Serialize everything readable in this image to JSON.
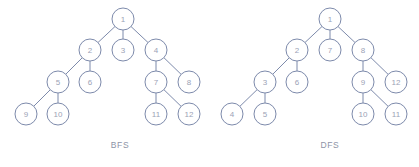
{
  "figure": {
    "background_color": "#ffffff",
    "stroke_color": "#7d8aab",
    "node_text_color": "#9ba2b6",
    "caption_color": "#8d93a6",
    "node_radius": 11,
    "width": 419,
    "height": 167
  },
  "diagrams": [
    {
      "id": "bfs",
      "caption": "BFS",
      "caption_x": 120,
      "caption_y": 145,
      "nodes": [
        {
          "label": "1",
          "x": 123,
          "y": 19
        },
        {
          "label": "2",
          "x": 90,
          "y": 50
        },
        {
          "label": "3",
          "x": 123,
          "y": 50
        },
        {
          "label": "4",
          "x": 156,
          "y": 50
        },
        {
          "label": "5",
          "x": 58,
          "y": 82
        },
        {
          "label": "6",
          "x": 90,
          "y": 82
        },
        {
          "label": "7",
          "x": 156,
          "y": 82
        },
        {
          "label": "8",
          "x": 189,
          "y": 82
        },
        {
          "label": "9",
          "x": 26,
          "y": 114
        },
        {
          "label": "10",
          "x": 58,
          "y": 114
        },
        {
          "label": "11",
          "x": 156,
          "y": 114
        },
        {
          "label": "12",
          "x": 189,
          "y": 114
        }
      ],
      "edges": [
        {
          "from": "1",
          "to": "2"
        },
        {
          "from": "1",
          "to": "3"
        },
        {
          "from": "1",
          "to": "4"
        },
        {
          "from": "2",
          "to": "5"
        },
        {
          "from": "2",
          "to": "6"
        },
        {
          "from": "4",
          "to": "7"
        },
        {
          "from": "4",
          "to": "8"
        },
        {
          "from": "5",
          "to": "9"
        },
        {
          "from": "5",
          "to": "10"
        },
        {
          "from": "7",
          "to": "11"
        },
        {
          "from": "7",
          "to": "12"
        }
      ]
    },
    {
      "id": "dfs",
      "caption": "DFS",
      "caption_x": 330,
      "caption_y": 145,
      "nodes": [
        {
          "label": "1",
          "x": 330,
          "y": 19
        },
        {
          "label": "2",
          "x": 297,
          "y": 50
        },
        {
          "label": "7",
          "x": 330,
          "y": 50
        },
        {
          "label": "8",
          "x": 363,
          "y": 50
        },
        {
          "label": "3",
          "x": 265,
          "y": 82
        },
        {
          "label": "6",
          "x": 297,
          "y": 82
        },
        {
          "label": "9",
          "x": 363,
          "y": 82
        },
        {
          "label": "12",
          "x": 396,
          "y": 82
        },
        {
          "label": "4",
          "x": 232,
          "y": 114
        },
        {
          "label": "5",
          "x": 265,
          "y": 114
        },
        {
          "label": "10",
          "x": 363,
          "y": 114
        },
        {
          "label": "11",
          "x": 396,
          "y": 114
        }
      ],
      "edges": [
        {
          "from": "1",
          "to": "2"
        },
        {
          "from": "1",
          "to": "7"
        },
        {
          "from": "1",
          "to": "8"
        },
        {
          "from": "2",
          "to": "3"
        },
        {
          "from": "2",
          "to": "6"
        },
        {
          "from": "8",
          "to": "9"
        },
        {
          "from": "8",
          "to": "12"
        },
        {
          "from": "3",
          "to": "4"
        },
        {
          "from": "3",
          "to": "5"
        },
        {
          "from": "9",
          "to": "10"
        },
        {
          "from": "9",
          "to": "11"
        }
      ]
    }
  ]
}
